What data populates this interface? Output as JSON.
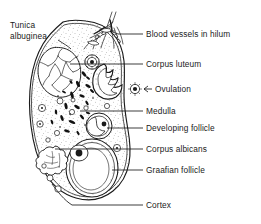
{
  "figure": {
    "type": "anatomical-diagram",
    "colors": {
      "ink": "#1a1a1a",
      "stroke": "#222222",
      "fill": "#ffffff",
      "stipple": "#555555"
    }
  },
  "labels": {
    "tunica_albuginea": "Tunica\nalbuginea",
    "tunica_albuginea_line1": "Tunica",
    "tunica_albuginea_line2": "albuginea",
    "blood_vessels": "Blood vessels in hilum",
    "corpus_luteum": "Corpus luteum",
    "ovulation": "Ovulation",
    "medulla": "Medulla",
    "developing_follicle": "Developing follicle",
    "corpus_albicans": "Corpus albicans",
    "graafian_follicle": "Graafian follicle",
    "cortex": "Cortex"
  },
  "structures": [
    {
      "name": "tunica-albuginea",
      "label": "Tunica albuginea",
      "side": "left"
    },
    {
      "name": "blood-vessels-in-hilum",
      "label": "Blood vessels in hilum",
      "side": "right"
    },
    {
      "name": "corpus-luteum",
      "label": "Corpus luteum",
      "side": "right"
    },
    {
      "name": "ovulation",
      "label": "Ovulation",
      "side": "right"
    },
    {
      "name": "medulla",
      "label": "Medulla",
      "side": "right"
    },
    {
      "name": "developing-follicle",
      "label": "Developing follicle",
      "side": "right"
    },
    {
      "name": "corpus-albicans",
      "label": "Corpus albicans",
      "side": "right"
    },
    {
      "name": "graafian-follicle",
      "label": "Graafian follicle",
      "side": "right"
    },
    {
      "name": "cortex",
      "label": "Cortex",
      "side": "right"
    }
  ]
}
